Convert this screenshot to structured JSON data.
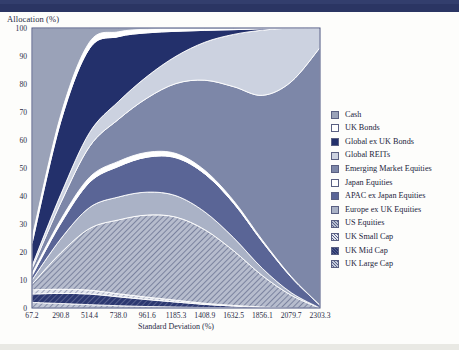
{
  "header": {
    "bar_color": "#2b3563"
  },
  "axes": {
    "y_title": "Allocation (%)",
    "x_title": "Standard Deviation (%)",
    "y_ticks": [
      "0",
      "10",
      "20",
      "30",
      "40",
      "50",
      "60",
      "70",
      "80",
      "90",
      "100"
    ],
    "x_ticks": [
      "67.2",
      "290.8",
      "514.4",
      "738.0",
      "961.6",
      "1185.3",
      "1408.9",
      "1632.5",
      "1856.1",
      "2079.7",
      "2303.3"
    ]
  },
  "legend": {
    "items": [
      {
        "label": "Cash",
        "color": "#9aa2b8",
        "pattern": "solid"
      },
      {
        "label": "UK Bonds",
        "color": "#ffffff",
        "pattern": "solid"
      },
      {
        "label": "Global ex UK Bonds",
        "color": "#23306b",
        "pattern": "solid"
      },
      {
        "label": "Global REITs",
        "color": "#ccd2e0",
        "pattern": "solid"
      },
      {
        "label": "Emerging Market Equities",
        "color": "#7d87a8",
        "pattern": "solid"
      },
      {
        "label": "Japan Equities",
        "color": "#ffffff",
        "pattern": "solid"
      },
      {
        "label": "APAC ex Japan Equities",
        "color": "#5a6596",
        "pattern": "solid"
      },
      {
        "label": "Europe ex UK Equities",
        "color": "#aab2c6",
        "pattern": "solid"
      },
      {
        "label": "US Equities",
        "color": "#b6bccd",
        "pattern": "hatch"
      },
      {
        "label": "UK Small Cap",
        "color": "#e3e6ee",
        "pattern": "hatch"
      },
      {
        "label": "UK Mid Cap",
        "color": "#2b3770",
        "pattern": "hatch"
      },
      {
        "label": "UK Large Cap",
        "color": "#c3c9d8",
        "pattern": "hatch"
      }
    ]
  },
  "chart_data": {
    "type": "area",
    "title": "",
    "xlabel": "Standard Deviation (%)",
    "ylabel": "Allocation (%)",
    "stacked": true,
    "normalized_percent": true,
    "xlim": [
      67.2,
      2303.3
    ],
    "ylim": [
      0,
      100
    ],
    "grid": false,
    "legend_position": "right",
    "x": [
      67.2,
      290.8,
      514.4,
      738.0,
      961.6,
      1185.3,
      1408.9,
      1632.5,
      1856.1,
      2079.7,
      2303.3
    ],
    "series": [
      {
        "name": "UK Large Cap",
        "values": [
          2.0,
          1.6,
          1.2,
          0.9,
          0.6,
          0.4,
          0.2,
          0.1,
          0.0,
          0.0,
          0.0
        ]
      },
      {
        "name": "UK Mid Cap",
        "values": [
          3.0,
          3.6,
          3.8,
          3.5,
          2.9,
          2.1,
          1.3,
          0.7,
          0.3,
          0.0,
          0.0
        ]
      },
      {
        "name": "UK Small Cap",
        "values": [
          1.5,
          1.5,
          1.4,
          1.2,
          1.0,
          0.8,
          0.5,
          0.3,
          0.1,
          0.0,
          0.0
        ]
      },
      {
        "name": "US Equities",
        "values": [
          2.0,
          13.0,
          22.0,
          29.0,
          34.0,
          35.0,
          31.0,
          23.0,
          13.0,
          5.0,
          0.0
        ]
      },
      {
        "name": "Europe ex UK Equities",
        "values": [
          1.5,
          5.0,
          7.5,
          9.0,
          9.5,
          9.0,
          7.5,
          5.5,
          3.0,
          1.0,
          0.0
        ]
      },
      {
        "name": "APAC ex Japan Equities",
        "values": [
          1.5,
          5.5,
          9.0,
          12.0,
          14.5,
          16.0,
          16.0,
          14.5,
          11.0,
          6.0,
          1.0
        ]
      },
      {
        "name": "Japan Equities",
        "values": [
          0.8,
          1.4,
          1.8,
          2.0,
          2.0,
          1.8,
          1.5,
          1.1,
          0.7,
          0.3,
          0.0
        ]
      },
      {
        "name": "Emerging Market Equities",
        "values": [
          1.7,
          6.0,
          11.0,
          16.5,
          22.5,
          29.5,
          38.0,
          48.0,
          60.0,
          76.0,
          92.0
        ]
      },
      {
        "name": "Global REITs",
        "values": [
          1.0,
          3.0,
          5.0,
          7.0,
          9.0,
          11.5,
          16.0,
          22.0,
          27.0,
          21.0,
          7.0
        ]
      },
      {
        "name": "Global ex UK Bonds",
        "values": [
          8.0,
          26.0,
          30.0,
          25.5,
          18.0,
          10.5,
          5.0,
          2.0,
          0.6,
          0.0,
          0.0
        ]
      },
      {
        "name": "UK Bonds",
        "values": [
          2.0,
          2.4,
          2.3,
          1.9,
          1.5,
          1.0,
          0.6,
          0.3,
          0.1,
          0.0,
          0.0
        ]
      },
      {
        "name": "Cash",
        "values": [
          75.0,
          31.0,
          5.0,
          1.5,
          0.5,
          0.4,
          0.4,
          0.4,
          0.2,
          0.0,
          0.0
        ]
      }
    ]
  }
}
